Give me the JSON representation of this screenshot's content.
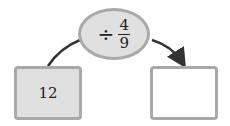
{
  "operation": {
    "symbol": "÷",
    "numerator": "4",
    "denominator": "9"
  },
  "input_box": {
    "value": "12"
  },
  "output_box": {
    "value": ""
  },
  "colors": {
    "fill": "#e0e0e0",
    "border": "#a9a9a9",
    "arrow": "#333333"
  }
}
